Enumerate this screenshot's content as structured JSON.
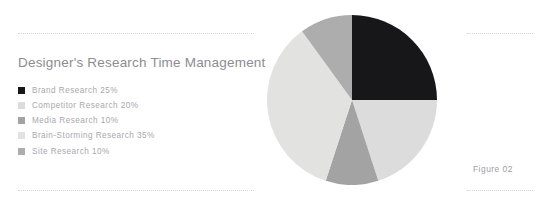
{
  "figure": {
    "title": "Designer's Research Time Management",
    "caption": "Figure 02"
  },
  "colors": {
    "background": "#ffffff",
    "title_text": "#8c8c92",
    "legend_text": "#a8a8ae",
    "caption_text": "#9b9ba1",
    "rule": "#d9d9dd"
  },
  "chart_data": {
    "type": "pie",
    "title": "Designer's Research Time Management",
    "xlabel": "",
    "ylabel": "",
    "legend_position": "left",
    "start_angle_deg": 0,
    "direction": "clockwise",
    "units": "percent",
    "total": 100,
    "categories": [
      "Brand Research",
      "Competitor Research",
      "Media Research",
      "Brain-Storming Research",
      "Site Research"
    ],
    "values": [
      25,
      20,
      10,
      35,
      10
    ],
    "slices": [
      {
        "label": "Brand Research",
        "value": 25,
        "value_text": "25%",
        "legend_text": "Brand Research 25%",
        "color": "#17171a"
      },
      {
        "label": "Competitor Research",
        "value": 20,
        "value_text": "20%",
        "legend_text": "Competitor Research 20%",
        "color": "#dcdcdc"
      },
      {
        "label": "Media Research",
        "value": 10,
        "value_text": "10%",
        "legend_text": "Media Research 10%",
        "color": "#a3a3a3"
      },
      {
        "label": "Brain-Storming Research",
        "value": 35,
        "value_text": "35%",
        "legend_text": "Brain-Storming Research 35%",
        "color": "#e2e2e0"
      },
      {
        "label": "Site Research",
        "value": 10,
        "value_text": "10%",
        "legend_text": "Site Research 10%",
        "color": "#adadad"
      }
    ]
  }
}
